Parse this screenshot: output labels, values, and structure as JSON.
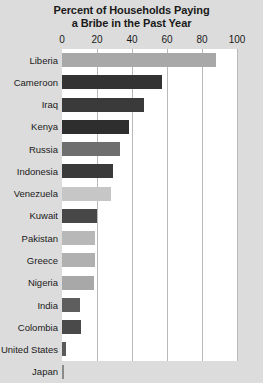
{
  "chart_data": {
    "type": "bar",
    "orientation": "horizontal",
    "title": "Percent of Households Paying a Bribe in the Past Year",
    "title_line1": "Percent of Households Paying",
    "title_line2": "a Bribe in the Past Year",
    "xlabel": "",
    "ylabel": "",
    "xlim": [
      0,
      100
    ],
    "xticks": [
      0,
      20,
      40,
      60,
      80,
      100
    ],
    "xtick_labels": [
      "0",
      "20",
      "40",
      "60",
      "80",
      "100"
    ],
    "grid": true,
    "grid_axis": "x",
    "legend": false,
    "categories": [
      "Liberia",
      "Cameroon",
      "Iraq",
      "Kenya",
      "Russia",
      "Indonesia",
      "Venezuela",
      "Kuwait",
      "Pakistan",
      "Greece",
      "Nigeria",
      "India",
      "Colombia",
      "United States",
      "Japan"
    ],
    "values": [
      88,
      57,
      47,
      38,
      33,
      29,
      28,
      20,
      19,
      19,
      18,
      10,
      11,
      2,
      1
    ],
    "bar_colors": [
      "#a8a8a8",
      "#333333",
      "#3a3a3a",
      "#2e2e2e",
      "#6e6e6e",
      "#3a3a3a",
      "#c6c6c6",
      "#474747",
      "#b8b8b8",
      "#b0b0b0",
      "#a8a8a8",
      "#5e5e5e",
      "#4a4a4a",
      "#5a5a5a",
      "#8a8a8a"
    ],
    "bars": [
      {
        "label": "Liberia",
        "value": 88,
        "color": "#a8a8a8"
      },
      {
        "label": "Cameroon",
        "value": 57,
        "color": "#333333"
      },
      {
        "label": "Iraq",
        "value": 47,
        "color": "#3a3a3a"
      },
      {
        "label": "Kenya",
        "value": 38,
        "color": "#2e2e2e"
      },
      {
        "label": "Russia",
        "value": 33,
        "color": "#6e6e6e"
      },
      {
        "label": "Indonesia",
        "value": 29,
        "color": "#3a3a3a"
      },
      {
        "label": "Venezuela",
        "value": 28,
        "color": "#c6c6c6"
      },
      {
        "label": "Kuwait",
        "value": 20,
        "color": "#474747"
      },
      {
        "label": "Pakistan",
        "value": 19,
        "color": "#b8b8b8"
      },
      {
        "label": "Greece",
        "value": 19,
        "color": "#b0b0b0"
      },
      {
        "label": "Nigeria",
        "value": 18,
        "color": "#a8a8a8"
      },
      {
        "label": "India",
        "value": 10,
        "color": "#5e5e5e"
      },
      {
        "label": "Colombia",
        "value": 11,
        "color": "#4a4a4a"
      },
      {
        "label": "United States",
        "value": 2,
        "color": "#5a5a5a"
      },
      {
        "label": "Japan",
        "value": 1,
        "color": "#8a8a8a"
      }
    ],
    "background_color": "#dcdcdc",
    "plot_background_color": "#ffffff",
    "gridline_color": "#b9b9b9",
    "text_color": "#1a1a1a"
  }
}
